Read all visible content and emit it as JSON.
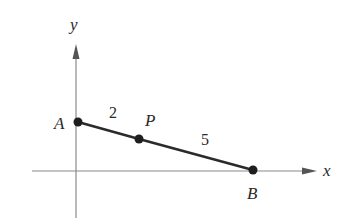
{
  "axes": {
    "x_label": "x",
    "y_label": "y"
  },
  "points": [
    {
      "id": "A",
      "label": "A"
    },
    {
      "id": "P",
      "label": "P"
    },
    {
      "id": "B",
      "label": "B"
    }
  ],
  "segments": [
    {
      "from": "A",
      "to": "P",
      "length_label": "2"
    },
    {
      "from": "P",
      "to": "B",
      "length_label": "5"
    }
  ],
  "colors": {
    "axis": "#8a8a8a",
    "segment": "#2b2b2b",
    "point": "#1e1e1e",
    "text": "#2a2a2a"
  }
}
